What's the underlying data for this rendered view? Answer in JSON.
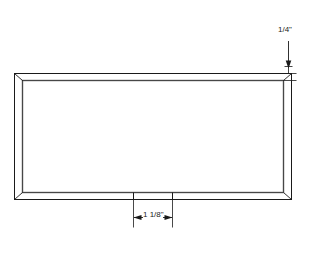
{
  "drawing": {
    "type": "technical-line-drawing",
    "subject": "rectangular panel frame elevation",
    "background_color": "#ffffff",
    "line_color": "#1a1a1a",
    "profile_shade_color": "#8c8c8c"
  },
  "frame": {
    "outer": {
      "x": 14,
      "y": 73,
      "width": 278,
      "height": 127
    },
    "inner": {
      "x": 22,
      "y": 80,
      "width": 262,
      "height": 113
    },
    "corner_joint": "mitered"
  },
  "dimensions": {
    "thickness": {
      "label": "1/4\"",
      "whole": "",
      "numerator": "1",
      "denominator": "4",
      "unit": "\"",
      "orientation": "vertical",
      "arrow": "down",
      "target": "top-rail"
    },
    "width": {
      "label": "1 1/8\"",
      "whole": "1",
      "numerator": "1",
      "denominator": "8",
      "unit": "\"",
      "orientation": "horizontal",
      "arrow": "both",
      "target": "bottom-rail-segment",
      "extension_x_left": 133,
      "extension_x_right": 172
    }
  }
}
